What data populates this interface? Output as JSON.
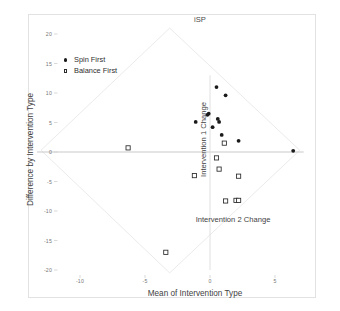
{
  "chart_data": {
    "type": "scatter",
    "title": "iSP",
    "xlabel": "Mean of Intervention Type",
    "ylabel": "Difference by Intervention Type",
    "inner_xlabel": "Intervention 2 Change",
    "inner_ylabel": "Intervention 1 Change",
    "xlim": [
      -13.5,
      8.5
    ],
    "ylim": [
      -21.5,
      21.5
    ],
    "xticks": [
      -10,
      -5,
      0,
      5
    ],
    "xtick_labels": [
      "-10",
      "-5",
      "0",
      "5"
    ],
    "yticks": [
      20,
      15,
      10,
      5,
      0,
      -5,
      -10,
      -15,
      -20
    ],
    "ytick_labels": [
      "20",
      "15",
      "10",
      "5",
      "0",
      "-5",
      "-10",
      "-15",
      "-20"
    ],
    "grid": false,
    "legend_position": "upper-left",
    "series": [
      {
        "name": "Spin First",
        "marker": "filled-circle",
        "color": "#1a1a1a",
        "points": [
          [
            0.5,
            11.0
          ],
          [
            1.2,
            9.6
          ],
          [
            -1.1,
            5.1
          ],
          [
            -0.2,
            6.3
          ],
          [
            -0.1,
            6.5
          ],
          [
            0.6,
            5.6
          ],
          [
            0.7,
            5.1
          ],
          [
            0.2,
            4.2
          ],
          [
            0.9,
            2.9
          ],
          [
            2.2,
            1.9
          ],
          [
            6.4,
            0.2
          ]
        ]
      },
      {
        "name": "Balance First",
        "marker": "open-square",
        "color": "#2a2a2a",
        "points": [
          [
            -6.3,
            0.7
          ],
          [
            1.1,
            1.5
          ],
          [
            0.5,
            -1.0
          ],
          [
            0.7,
            -2.9
          ],
          [
            -1.2,
            -4.0
          ],
          [
            2.2,
            -4.1
          ],
          [
            1.2,
            -8.3
          ],
          [
            2.0,
            -8.2
          ],
          [
            2.2,
            -8.2
          ],
          [
            -3.4,
            -17.0
          ]
        ]
      }
    ],
    "reference_lines": [
      {
        "name": "zero-difference-line",
        "orientation": "horizontal",
        "value": 0
      },
      {
        "name": "inner-vertical-axis",
        "orientation": "vertical",
        "value": 0
      }
    ],
    "diamond_axes": {
      "description": "rotated 45-degree reference diamond for Intervention 1 and Intervention 2 change axes",
      "top_vertex": [
        -3.1,
        21.0
      ],
      "bottom_vertex": [
        -3.1,
        -20.5
      ],
      "left_vertex": [
        -13.0,
        0.3
      ],
      "right_vertex": [
        6.9,
        0.3
      ]
    }
  },
  "legend": {
    "entries": [
      {
        "label": "Spin First",
        "marker": "filled-circle"
      },
      {
        "label": "Balance First",
        "marker": "open-square"
      }
    ]
  }
}
